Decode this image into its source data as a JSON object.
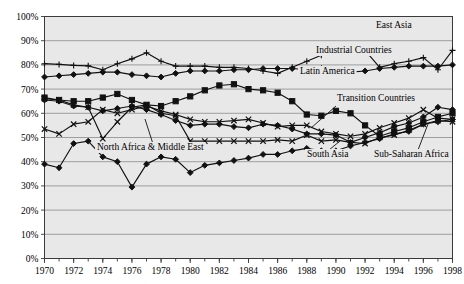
{
  "chart_data": {
    "type": "line",
    "title": "",
    "xlabel": "",
    "ylabel": "",
    "xlim": [
      1970,
      1998
    ],
    "ylim": [
      0,
      100
    ],
    "ytick_step": 10,
    "grid": true,
    "legend_position": "inline-annotations",
    "ytick_labels": [
      "0%",
      "10%",
      "20%",
      "30%",
      "40%",
      "50%",
      "60%",
      "70%",
      "80%",
      "90%",
      "100%"
    ],
    "ytick_values": [
      0,
      10,
      20,
      30,
      40,
      50,
      60,
      70,
      80,
      90,
      100
    ],
    "xtick_labels": [
      "1970",
      "1972",
      "1974",
      "1976",
      "1978",
      "1980",
      "1982",
      "1984",
      "1986",
      "1988",
      "1990",
      "1992",
      "1994",
      "1996",
      "1998"
    ],
    "xtick_values": [
      1970,
      1972,
      1974,
      1976,
      1978,
      1980,
      1982,
      1984,
      1986,
      1988,
      1990,
      1992,
      1994,
      1996,
      1998
    ],
    "x": [
      1970,
      1971,
      1972,
      1973,
      1974,
      1975,
      1976,
      1977,
      1978,
      1979,
      1980,
      1981,
      1982,
      1983,
      1984,
      1985,
      1986,
      1987,
      1988,
      1989,
      1990,
      1991,
      1992,
      1993,
      1994,
      1995,
      1996,
      1997,
      1998
    ],
    "series": [
      {
        "name": "East Asia",
        "marker": "plus",
        "label": "East Asia",
        "label_x": 376,
        "label_y": 28,
        "values": [
          80.5,
          80.2,
          79.8,
          79.6,
          78.0,
          80.5,
          82.5,
          85.0,
          81.5,
          79.5,
          79.5,
          79.5,
          79.0,
          79.0,
          78.5,
          77.5,
          76.5,
          79.0,
          81.5,
          84.0,
          86.5,
          85.0,
          86.0,
          79.0,
          80.5,
          81.5,
          83.0,
          78.0,
          86.0
        ]
      },
      {
        "name": "Industrial Countries",
        "marker": "diamond",
        "label": "Industrial Countries",
        "label_x": 316,
        "label_y": 53,
        "values": [
          75.0,
          75.5,
          76.0,
          76.5,
          77.0,
          77.0,
          76.0,
          75.5,
          75.0,
          76.5,
          77.5,
          77.5,
          77.5,
          78.0,
          78.0,
          78.5,
          78.5,
          78.5,
          78.0,
          78.5,
          77.0,
          77.0,
          77.5,
          78.5,
          79.0,
          79.5,
          79.5,
          79.5,
          80.0
        ]
      },
      {
        "name": "Latin America",
        "marker": "square",
        "label": "Latin America",
        "label_x": 300,
        "label_y": 74,
        "values": [
          66.5,
          65.5,
          65.0,
          65.0,
          66.5,
          68.0,
          65.5,
          63.5,
          63.0,
          65.0,
          67.0,
          69.5,
          71.5,
          72.0,
          70.0,
          69.5,
          68.5,
          65.0,
          59.5,
          59.0,
          61.0,
          60.0,
          55.0,
          50.5,
          52.5,
          54.0,
          56.5,
          58.5,
          60.0
        ]
      },
      {
        "name": "Transition Countries",
        "marker": "diamond",
        "label": "Transition Countries",
        "label_x": 337,
        "label_y": 101,
        "values": [
          65.5,
          65.0,
          63.0,
          62.5,
          61.0,
          62.0,
          63.0,
          61.5,
          59.5,
          57.0,
          55.0,
          55.5,
          55.5,
          54.5,
          54.0,
          55.5,
          55.0,
          53.5,
          51.5,
          51.5,
          51.0,
          48.0,
          50.0,
          52.0,
          54.5,
          56.0,
          58.5,
          62.5,
          61.5
        ]
      },
      {
        "name": "North Africa & Middle East",
        "marker": "cross",
        "label": "North Africa & Middle East",
        "label_x": 97,
        "label_y": 150,
        "values": [
          53.5,
          51.5,
          55.5,
          56.5,
          61.5,
          60.0,
          61.5,
          63.0,
          61.0,
          59.5,
          57.5,
          56.5,
          56.5,
          57.0,
          57.5,
          56.0,
          54.5,
          55.0,
          55.0,
          52.5,
          51.5,
          50.5,
          51.5,
          54.0,
          56.0,
          58.0,
          61.5,
          58.0,
          57.5
        ]
      },
      {
        "name": "South Asia",
        "marker": "cross",
        "label": "South Asia",
        "label_x": 307,
        "label_y": 157,
        "values": [
          66.0,
          65.5,
          63.5,
          62.5,
          49.5,
          56.5,
          62.5,
          63.5,
          60.0,
          59.0,
          48.5,
          48.5,
          48.5,
          48.5,
          48.5,
          48.5,
          49.0,
          48.5,
          51.0,
          48.5,
          49.0,
          48.0,
          47.5,
          50.0,
          51.0,
          53.0,
          55.5,
          57.0,
          56.5
        ]
      },
      {
        "name": "Sub-Saharan Africa",
        "marker": "diamond",
        "label": "Sub-Saharan Africa",
        "label_x": 374,
        "label_y": 157,
        "values": [
          39.0,
          37.5,
          47.5,
          48.5,
          42.0,
          40.0,
          29.5,
          39.0,
          42.0,
          41.0,
          35.5,
          38.5,
          39.5,
          40.5,
          41.5,
          43.0,
          43.0,
          44.5,
          45.5,
          44.5,
          44.5,
          46.5,
          48.0,
          49.5,
          51.5,
          52.5,
          55.5,
          56.5,
          57.5
        ]
      }
    ],
    "annotations": [
      {
        "name": "leader-north-africa",
        "from_x": 153,
        "from_y": 144,
        "to_x": 145,
        "to_y": 119
      },
      {
        "name": "leader-transition",
        "from_x": 336,
        "from_y": 106,
        "to_x": 311,
        "to_y": 128
      },
      {
        "name": "leader-south-asia",
        "from_x": 329,
        "from_y": 150,
        "to_x": 340,
        "to_y": 141
      },
      {
        "name": "leader-subsaharan",
        "from_x": 418,
        "from_y": 150,
        "to_x": 428,
        "to_y": 124
      }
    ]
  }
}
